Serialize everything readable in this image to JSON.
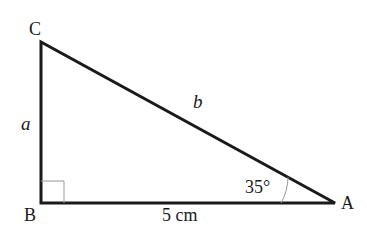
{
  "diagram": {
    "type": "right-triangle",
    "vertices": {
      "A": {
        "label": "A",
        "x": 335,
        "y": 203
      },
      "B": {
        "label": "B",
        "x": 41,
        "y": 203
      },
      "C": {
        "label": "C",
        "x": 41,
        "y": 42
      }
    },
    "sides": {
      "a": {
        "label": "a"
      },
      "b": {
        "label": "b"
      },
      "base": {
        "label": "5 cm"
      }
    },
    "angle_A": {
      "label": "35°"
    },
    "right_angle_at": "B",
    "colors": {
      "line": "#1a1a1a",
      "marker": "#999999",
      "background": "#ffffff"
    }
  }
}
